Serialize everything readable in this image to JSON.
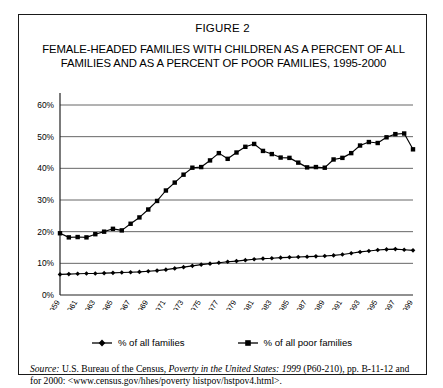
{
  "figure": {
    "number": "FIGURE 2",
    "title": "FEMALE-HEADED FAMILIES WITH CHILDREN AS A PERCENT OF ALL FAMILIES AND AS A PERCENT OF POOR FAMILIES, 1995-2000"
  },
  "legend": {
    "items": [
      {
        "label": "% of all families",
        "marker": "diamond-marker",
        "color": "#000000"
      },
      {
        "label": "% of all poor families",
        "marker": "square-marker",
        "color": "#000000"
      }
    ]
  },
  "source": {
    "label": "Source:",
    "text_1": " U.S. Bureau of the Census, ",
    "italic_title": "Poverty in the United States: 1999",
    "text_2": " (P60-210), pp. B-11-12 and for 2000: <www.census.gov/hhes/poverty histpov/hstpov4.html>."
  },
  "chart_data": {
    "type": "line",
    "title": "FEMALE-HEADED FAMILIES WITH CHILDREN AS A PERCENT OF ALL FAMILIES AND AS A PERCENT OF POOR FAMILIES, 1995-2000",
    "xlabel": "",
    "ylabel": "",
    "ylim": [
      0,
      60
    ],
    "ytick_labels": [
      "0%",
      "10%",
      "20%",
      "30%",
      "40%",
      "50%",
      "60%"
    ],
    "ytick_values": [
      0,
      10,
      20,
      30,
      40,
      50,
      60
    ],
    "grid": true,
    "legend_position": "bottom",
    "x": [
      1959,
      1960,
      1961,
      1962,
      1963,
      1964,
      1965,
      1966,
      1967,
      1968,
      1969,
      1970,
      1971,
      1972,
      1973,
      1974,
      1975,
      1976,
      1977,
      1978,
      1979,
      1980,
      1981,
      1982,
      1983,
      1984,
      1985,
      1986,
      1987,
      1988,
      1989,
      1990,
      1991,
      1992,
      1993,
      1994,
      1995,
      1996,
      1997,
      1998,
      1999
    ],
    "xtick_labels": [
      "1959",
      "1961",
      "1963",
      "1965",
      "1967",
      "1969",
      "1971",
      "1973",
      "1975",
      "1977",
      "1979",
      "1981",
      "1983",
      "1985",
      "1987",
      "1989",
      "1991",
      "1993",
      "1995",
      "1997",
      "1999"
    ],
    "series": [
      {
        "name": "% of all families",
        "marker": "diamond",
        "values": [
          6.5,
          6.6,
          6.7,
          6.8,
          6.8,
          6.9,
          7.0,
          7.1,
          7.2,
          7.3,
          7.5,
          7.7,
          8.0,
          8.4,
          8.8,
          9.2,
          9.6,
          9.9,
          10.2,
          10.5,
          10.7,
          11.0,
          11.3,
          11.5,
          11.6,
          11.8,
          11.9,
          12.0,
          12.1,
          12.2,
          12.3,
          12.5,
          12.8,
          13.2,
          13.6,
          13.9,
          14.2,
          14.4,
          14.5,
          14.3,
          14.1
        ]
      },
      {
        "name": "% of all poor families",
        "marker": "square",
        "values": [
          19.5,
          18.2,
          18.3,
          18.2,
          19.2,
          20.0,
          20.9,
          20.4,
          22.5,
          24.5,
          27.0,
          29.7,
          33.0,
          35.5,
          38.0,
          40.2,
          40.4,
          42.5,
          44.8,
          43.0,
          45.0,
          46.8,
          47.7,
          45.5,
          44.5,
          43.4,
          43.3,
          41.8,
          40.3,
          40.4,
          40.2,
          42.8,
          43.3,
          44.8,
          47.2,
          48.3,
          48.0,
          49.8,
          50.8,
          51.0,
          46.0
        ]
      }
    ]
  }
}
